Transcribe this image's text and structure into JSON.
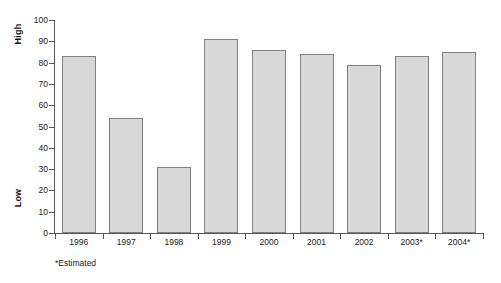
{
  "chart_data": {
    "type": "bar",
    "title": "",
    "xlabel": "",
    "ylabel": "High / Low",
    "categories": [
      "1996",
      "1997",
      "1998",
      "1999",
      "2000",
      "2001",
      "2002",
      "2003*",
      "2004*"
    ],
    "values": [
      83,
      54,
      31,
      91,
      86,
      84,
      79,
      83,
      85
    ],
    "ylim": [
      0,
      100
    ],
    "yticks": [
      0,
      10,
      20,
      30,
      40,
      50,
      60,
      70,
      80,
      90,
      100
    ],
    "ytick_labels": [
      "0",
      "10",
      "20",
      "30",
      "40",
      "50",
      "60",
      "70",
      "80",
      "90",
      "100"
    ],
    "grid": false,
    "legend": false,
    "bar_fill_color": "#d8d8d8",
    "bar_border_color": "#808080",
    "axis_color": "#555555"
  },
  "axis_titles": {
    "high": "High",
    "low": "Low"
  },
  "footnote": {
    "text": "*Estimated"
  }
}
